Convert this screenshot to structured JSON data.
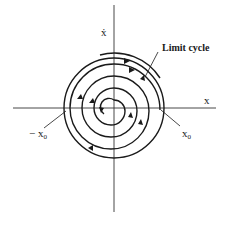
{
  "diagram": {
    "type": "phase-portrait",
    "axes": {
      "x_label": "x",
      "y_label": "ẋ"
    },
    "annotations": {
      "limit_cycle": "Limit cycle",
      "neg_x0_prefix": "− x",
      "neg_x0_sub": "0",
      "pos_x0_prefix": "x",
      "pos_x0_sub": "0"
    },
    "colors": {
      "stroke": "#1a1a1a",
      "axis": "#333333",
      "background": "#ffffff"
    },
    "geometry": {
      "center": [
        114,
        108
      ],
      "limit_cycle_radius": 50
    }
  }
}
